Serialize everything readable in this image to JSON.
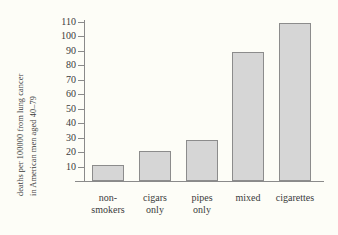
{
  "chart_data": {
    "type": "bar",
    "title": "",
    "xlabel": "",
    "ylabel": "deaths per 100000 from lung cancer in American men aged 40-79",
    "ylabel_lines": [
      "deaths per 100000 from lung cancer",
      "in American men aged 40–79"
    ],
    "categories": [
      "non-smokers",
      "cigars only",
      "pipes only",
      "mixed",
      "cigarettes"
    ],
    "category_lines": [
      [
        "non-",
        "smokers"
      ],
      [
        "cigars",
        "only"
      ],
      [
        "pipes",
        "only"
      ],
      [
        "mixed",
        ""
      ],
      [
        "cigarettes",
        ""
      ]
    ],
    "values": [
      11,
      21,
      28,
      89,
      109
    ],
    "ylim": [
      0,
      115
    ],
    "yticks": [
      10,
      20,
      30,
      40,
      50,
      60,
      70,
      80,
      90,
      100,
      110
    ],
    "ytick_labels": [
      "10",
      "20",
      "30",
      "40",
      "50",
      "60",
      "70",
      "80",
      "90",
      "100",
      "110"
    ],
    "grid": false,
    "legend": null,
    "bar_fill_color": "#d6d6d6",
    "bar_edge_color": "#8c8c8c",
    "axis_color": "#8a8a8a",
    "background_color": "#fdfdf7",
    "text_color": "#3b3b3b"
  }
}
